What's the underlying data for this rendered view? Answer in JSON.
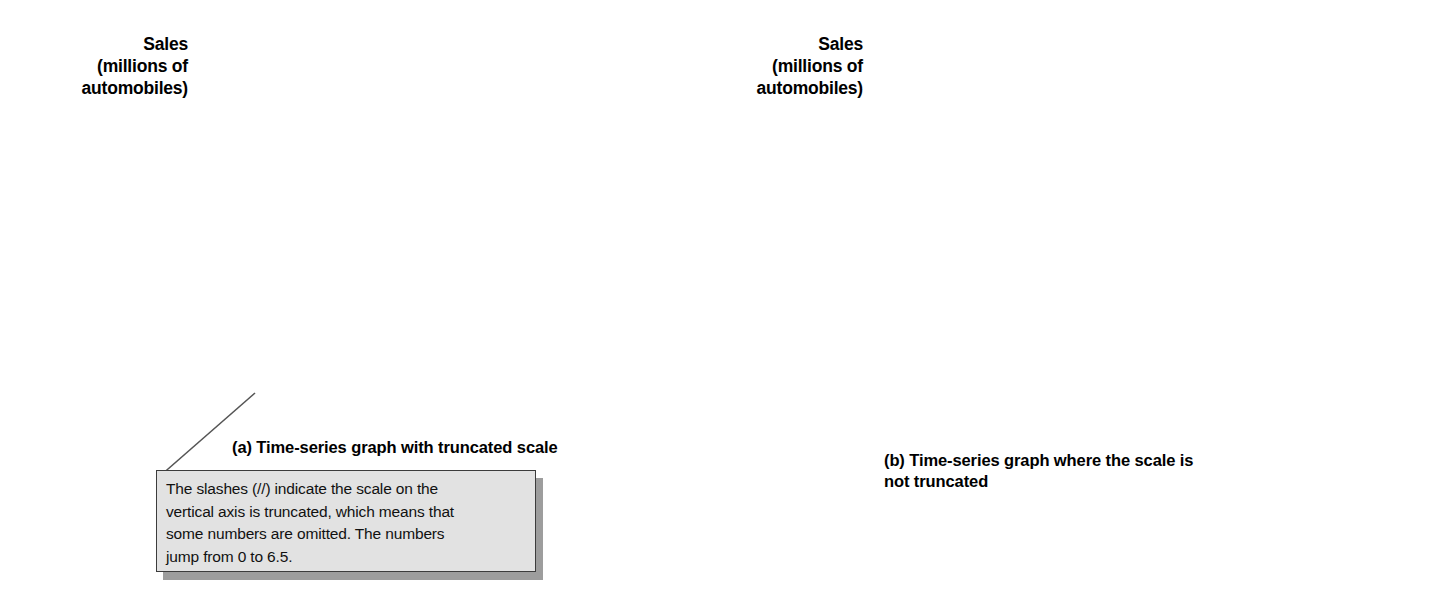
{
  "figure": {
    "background_color": "#ffffff",
    "line_color": "#1a1a1a",
    "axis_color": "#555555",
    "grid_color": "#777777"
  },
  "panel_a": {
    "axis_title_line1": "Sales",
    "axis_title_line2": "(millions of",
    "axis_title_line3": "automobiles)",
    "caption": "(a) Time-series graph with truncated scale",
    "truncation_marker": "//"
  },
  "panel_b": {
    "axis_title_line1": "Sales",
    "axis_title_line2": "(millions of",
    "axis_title_line3": "automobiles)",
    "caption_line1": "(b) Time-series graph where the scale is",
    "caption_line2": "not truncated"
  },
  "callout": {
    "line1": "The slashes (//) indicate the scale on the",
    "line2": "vertical axis is truncated, which means that",
    "line3": "some numbers are omitted.  The numbers",
    "line4": "jump from 0 to 6.5."
  },
  "chart_data": [
    {
      "type": "line",
      "title": "(a) Time-series graph with truncated scale",
      "xlabel": "",
      "ylabel": "Sales (millions of automobiles)",
      "categories": [
        "2000",
        "2001",
        "2002",
        "2003",
        "2004",
        "2005",
        "2006",
        "2007"
      ],
      "x": [
        2000,
        2001,
        2002,
        2003,
        2004,
        2005,
        2006,
        2007
      ],
      "values": [
        7.4,
        7.0,
        7.0,
        6.7,
        6.8,
        6.8,
        6.6,
        6.6
      ],
      "ytick_labels": [
        "7.5",
        "7.4",
        "7.3",
        "7.2",
        "7.1",
        "7.0",
        "6.9",
        "6.8",
        "6.7",
        "6.6",
        "6.5",
        "0.0"
      ],
      "ytick_values": [
        7.5,
        7.4,
        7.3,
        7.2,
        7.1,
        7.0,
        6.9,
        6.8,
        6.7,
        6.6,
        6.5,
        0.0
      ],
      "ylim": [
        6.5,
        7.5
      ],
      "axis_truncated": true,
      "grid": true,
      "legend": "none"
    },
    {
      "type": "line",
      "title": "(b) Time-series graph where the scale is not truncated",
      "xlabel": "",
      "ylabel": "Sales (millions of automobiles)",
      "categories": [
        "2000",
        "2001",
        "2002",
        "2003",
        "2004",
        "2005",
        "2006",
        "2007"
      ],
      "x": [
        2000,
        2001,
        2002,
        2003,
        2004,
        2005,
        2006,
        2007
      ],
      "values": [
        7.4,
        7.0,
        7.0,
        6.7,
        6.8,
        6.8,
        6.6,
        6.6
      ],
      "ytick_labels": [
        "8.0",
        "7.0",
        "6.0",
        "5.0",
        "4.0",
        "3.0",
        "2.0",
        "1.0",
        "0.0"
      ],
      "ytick_values": [
        8.0,
        7.0,
        6.0,
        5.0,
        4.0,
        3.0,
        2.0,
        1.0,
        0.0
      ],
      "ylim": [
        0.0,
        8.0
      ],
      "axis_truncated": false,
      "grid": true,
      "legend": "none"
    }
  ]
}
